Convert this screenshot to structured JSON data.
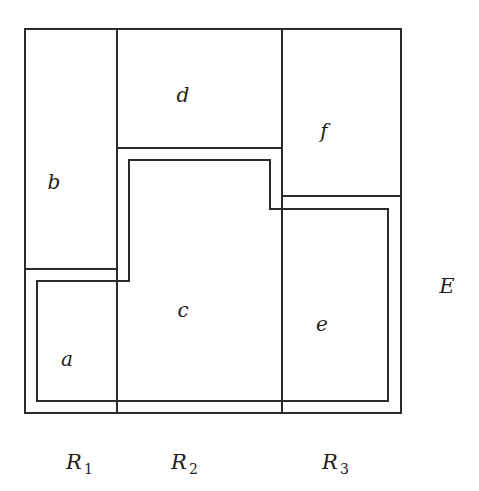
{
  "diagram": {
    "stroke_color": "#2b2b2b",
    "background": "#ffffff",
    "outer_frame": {
      "x": 25,
      "y": 29,
      "w": 376,
      "h": 384
    },
    "dividers": {
      "r1_r2_x": 117,
      "r2_r3_x": 282,
      "b_bottom_y": 269,
      "d_bottom_y": 148,
      "f_bottom_y": 196
    },
    "inner_region_path": "M37,281 L129,281 L129,160 L270,160 L270,209 L388,209 L388,401 L37,401 Z",
    "cells": [
      {
        "id": "a",
        "label": "a",
        "x": 67,
        "y": 366
      },
      {
        "id": "b",
        "label": "b",
        "x": 54,
        "y": 184
      },
      {
        "id": "c",
        "label": "c",
        "x": 183,
        "y": 317
      },
      {
        "id": "d",
        "label": "d",
        "x": 183,
        "y": 102
      },
      {
        "id": "e",
        "label": "e",
        "x": 322,
        "y": 331
      },
      {
        "id": "f",
        "label": "f",
        "x": 324,
        "y": 136
      }
    ],
    "outside_label": {
      "label": "E",
      "x": 447,
      "y": 293
    },
    "column_labels": [
      {
        "main": "R",
        "sub": "1",
        "x": 77,
        "y": 469
      },
      {
        "main": "R",
        "sub": "2",
        "x": 181,
        "y": 469
      },
      {
        "main": "R",
        "sub": "3",
        "x": 333,
        "y": 469
      }
    ]
  }
}
